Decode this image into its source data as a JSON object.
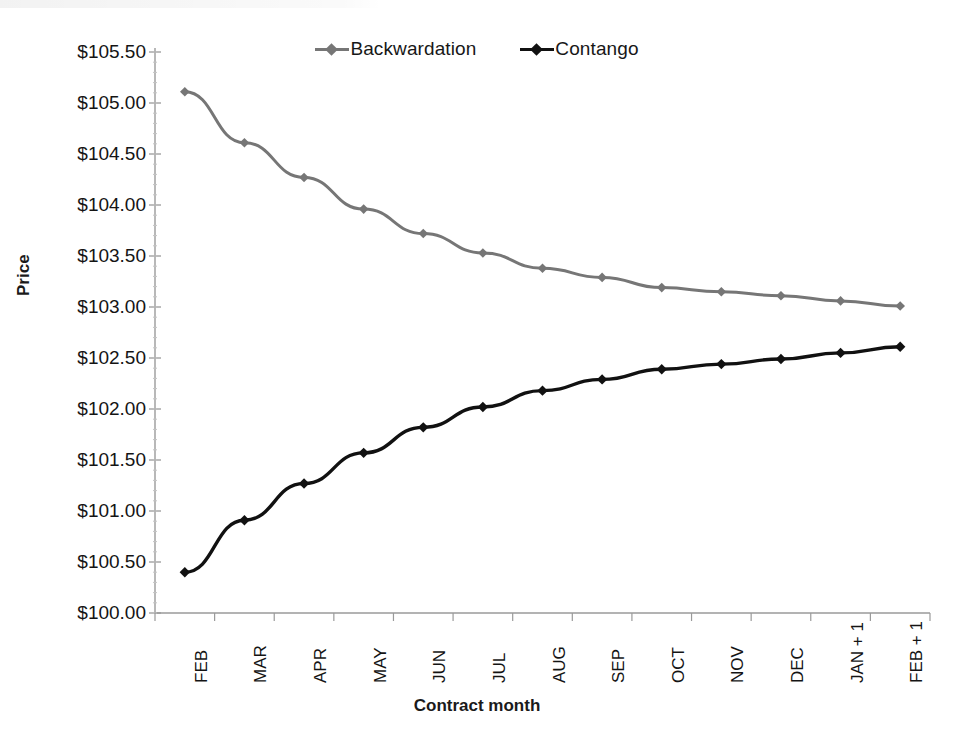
{
  "chart_data": {
    "type": "line",
    "title": "",
    "xlabel": "Contract month",
    "ylabel": "Price",
    "categories": [
      "FEB",
      "MAR",
      "APR",
      "MAY",
      "JUN",
      "JUL",
      "AUG",
      "SEP",
      "OCT",
      "NOV",
      "DEC",
      "JAN + 1",
      "FEB + 1"
    ],
    "ytick_labels": [
      "$105.50",
      "$105.00",
      "$104.50",
      "$104.00",
      "$103.50",
      "$103.00",
      "$102.50",
      "$102.00",
      "$101.50",
      "$101.00",
      "$100.50",
      "$100.00"
    ],
    "ytick_values": [
      105.5,
      105.0,
      104.5,
      104.0,
      103.5,
      103.0,
      102.5,
      102.0,
      101.5,
      101.0,
      100.5,
      100.0
    ],
    "ylim": [
      100.0,
      105.5
    ],
    "ystep": 0.5,
    "grid": false,
    "legend_position": "top-center",
    "series": [
      {
        "name": "Backwardation",
        "color": "#767676",
        "marker": "diamond",
        "values": [
          105.11,
          104.61,
          104.27,
          103.96,
          103.72,
          103.53,
          103.38,
          103.29,
          103.19,
          103.15,
          103.11,
          103.06,
          103.01
        ]
      },
      {
        "name": "Contango",
        "color": "#111111",
        "marker": "diamond",
        "values": [
          100.4,
          100.91,
          101.27,
          101.57,
          101.82,
          102.02,
          102.18,
          102.29,
          102.39,
          102.44,
          102.49,
          102.55,
          102.61
        ]
      }
    ]
  },
  "legend": {
    "items": [
      {
        "label": "Backwardation",
        "color": "#767676"
      },
      {
        "label": "Contango",
        "color": "#111111"
      }
    ]
  },
  "axes": {
    "y_title": "Price",
    "x_title": "Contract month"
  }
}
